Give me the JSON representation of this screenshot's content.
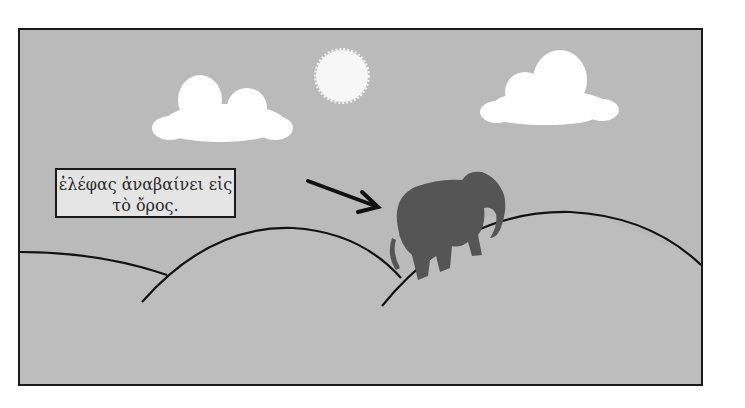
{
  "scene": {
    "caption": {
      "line1": "ἐλέφας ἀναβαίνει εἰς",
      "line2": "τὸ ὄρος."
    },
    "elements": [
      "sun",
      "cloud-left",
      "cloud-right",
      "hills",
      "elephant",
      "arrow"
    ],
    "colors": {
      "sky": "#bababa",
      "frame_border": "#1a1a1a",
      "caption_bg": "#e4e4e4",
      "cloud": "#ffffff",
      "sun": "#f7f7f7",
      "elephant": "#555555",
      "line": "#111111"
    }
  }
}
